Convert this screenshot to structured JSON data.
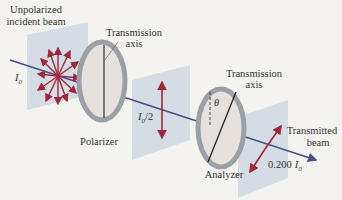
{
  "labels": {
    "incident_line1": "Unpolarized",
    "incident_line2": "incident beam",
    "incident_intensity": "I",
    "incident_intensity_sub": "0",
    "polarizer_axis_line1": "Transmission",
    "polarizer_axis_line2": "axis",
    "polarizer": "Polarizer",
    "middle_intensity": "I",
    "middle_intensity_sub": "0",
    "middle_intensity_suffix": "/2",
    "analyzer_axis_line1": "Transmission",
    "analyzer_axis_line2": "axis",
    "angle": "θ",
    "analyzer": "Analyzer",
    "transmitted_line1": "Transmitted",
    "transmitted_line2": "beam",
    "transmitted_value": "0.200",
    "transmitted_intensity": "I",
    "transmitted_intensity_sub": "0"
  },
  "colors": {
    "background": "#f4f3ef",
    "plane": "#c9d6e0",
    "beam": "#4a4f8a",
    "arrow": "#a3263a",
    "ring": "#9aa0a6",
    "disk": "#e6e1dc",
    "text": "#333333"
  }
}
